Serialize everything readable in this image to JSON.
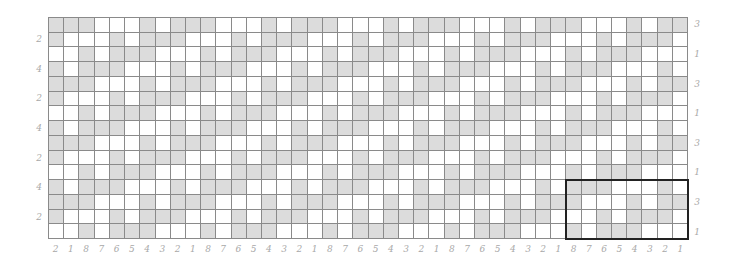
{
  "chart": {
    "title": "",
    "columns": 42,
    "rows": 15,
    "colors": {
      "shaded": "#dcdcdc",
      "empty": "#ffffff",
      "grid_line": "#8a8a8a",
      "label": "#a8a8a8",
      "highlight_box": "#222222"
    },
    "pattern_rows": [
      "GGGWWWGWGGGWWWGWGGGWWWGWGGGWWWGWGGGWWWGWGG",
      "GWWWGWGGGWWWGWGGGWWWGWGGGWWWGWGGGWWWGWGGGW",
      "WWGWGGGWWWGWGGGWWWGWGGGWWWGWGGGWWWGWGGGWWW",
      "GWGGGWWWGWGGGWWWGWGGGWWWGWGGGWWWGWGGGWWWGW",
      "GGGWWWGWGGGWWWGWGGGWWWGWGGGWWWGWGGGWWWGWGG",
      "GWWWGWGGGWWWGWGGGWWWGWGGGWWWGWGGGWWWGWGGGW",
      "WWGWGGGWWWGWGGGWWWGWGGGWWWGWGGGWWWGWGGGWWW",
      "GWGGGWWWGWGGGWWWGWGGGWWWGWGGGWWWGWGGGWWWGW",
      "GGGWWWGWGGGWWWGWGGGWWWGWGGGWWWGWGGGWWWGWGG",
      "GWWWGWGGGWWWGWGGGWWWGWGGGWWWGWGGGWWWGWGGGW",
      "WWGWGGGWWWGWGGGWWWGWGGGWWWGWGGGWWWGWGGGWWW",
      "GWGGGWWWGWGGGWWWGWGGGWWWGWGGGWWWGWGGGWWWGW",
      "GGGWWWGWGGGWWWGWGGGWWWGWGGGWWWGWGGGWWWGWGG",
      "GWWWGWGGGWWWGWGGGWWWGWGGGWWWGWGGGWWWGWGGGW",
      "WWGWGGGWWWGWGGGWWWGWGGGWWWGWGGGWWWGWGGGWWW"
    ],
    "bottom_labels": [
      "2",
      "1",
      "8",
      "7",
      "6",
      "5",
      "4",
      "3",
      "2",
      "1",
      "8",
      "7",
      "6",
      "5",
      "4",
      "3",
      "2",
      "1",
      "8",
      "7",
      "6",
      "5",
      "4",
      "3",
      "2",
      "1",
      "8",
      "7",
      "6",
      "5",
      "4",
      "3",
      "2",
      "1",
      "8",
      "7",
      "6",
      "5",
      "4",
      "3",
      "2",
      "1"
    ],
    "left_labels": [
      {
        "row": 1,
        "text": "2"
      },
      {
        "row": 3,
        "text": "4"
      },
      {
        "row": 5,
        "text": "2"
      },
      {
        "row": 7,
        "text": "4"
      },
      {
        "row": 9,
        "text": "2"
      },
      {
        "row": 11,
        "text": "4"
      },
      {
        "row": 13,
        "text": "2"
      }
    ],
    "right_labels": [
      {
        "row": 0,
        "text": "3"
      },
      {
        "row": 2,
        "text": "1"
      },
      {
        "row": 4,
        "text": "3"
      },
      {
        "row": 6,
        "text": "1"
      },
      {
        "row": 8,
        "text": "3"
      },
      {
        "row": 10,
        "text": "1"
      },
      {
        "row": 12,
        "text": "3"
      },
      {
        "row": 14,
        "text": "1"
      }
    ],
    "highlight_box": {
      "col_start": 34,
      "col_end": 41,
      "row_start": 11,
      "row_end": 14,
      "label": "repeat unit"
    }
  }
}
